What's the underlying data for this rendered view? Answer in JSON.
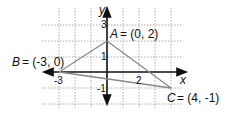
{
  "figure": {
    "axis_labels": {
      "x": "x",
      "y": "y"
    },
    "tick_labels": {
      "y3": "3",
      "y1": "1",
      "yneg1": "-1",
      "xneg3": "-3",
      "x2": "2"
    },
    "points": {
      "A": {
        "name": "A",
        "coords": "= (0, 2)"
      },
      "B": {
        "name": "B",
        "coords": "= (-3, 0)"
      },
      "C": {
        "name": "C",
        "coords": "= (4, -1)"
      }
    }
  }
}
